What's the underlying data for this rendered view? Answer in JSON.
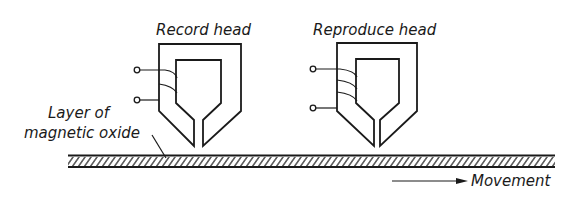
{
  "labels": {
    "record_head": "Record head",
    "reproduce_head": "Reproduce head",
    "layer_line1": "Layer of",
    "layer_line2": "magnetic oxide",
    "movement": "Movement"
  },
  "heads": [
    {
      "name": "record-head",
      "coil_turns": 2
    },
    {
      "name": "reproduce-head",
      "coil_turns": 3
    }
  ],
  "colors": {
    "ink": "#1a1a1a",
    "background": "#ffffff"
  }
}
